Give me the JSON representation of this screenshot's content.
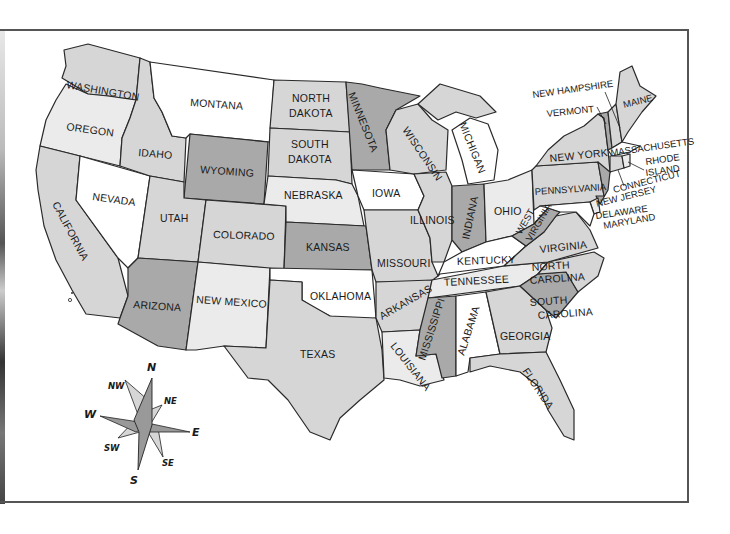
{
  "map": {
    "title": "United States",
    "colors": {
      "white": "#ffffff",
      "light": "#ebebeb",
      "medium": "#d6d6d6",
      "dark": "#a9a9a9",
      "border": "#2a2a2a",
      "frame": "#555555"
    },
    "states": {
      "washington": "WASHINGTON",
      "oregon": "OREGON",
      "california": "CALIFORNIA",
      "nevada": "NEVADA",
      "idaho": "IDAHO",
      "montana": "MONTANA",
      "wyoming": "WYOMING",
      "utah": "UTAH",
      "arizona": "ARIZONA",
      "colorado": "COLORADO",
      "new_mexico": "NEW MEXICO",
      "north_dakota_1": "NORTH",
      "north_dakota_2": "DAKOTA",
      "south_dakota_1": "SOUTH",
      "south_dakota_2": "DAKOTA",
      "nebraska": "NEBRASKA",
      "kansas": "KANSAS",
      "oklahoma": "OKLAHOMA",
      "texas": "TEXAS",
      "minnesota": "MINNESOTA",
      "iowa": "IOWA",
      "missouri": "MISSOURI",
      "arkansas": "ARKANSAS",
      "louisiana": "LOUISIANA",
      "wisconsin": "WISCONSIN",
      "michigan": "MICHIGAN",
      "illinois": "ILLINOIS",
      "indiana": "INDIANA",
      "ohio": "OHIO",
      "kentucky": "KENTUCKY",
      "tennessee": "TENNESSEE",
      "mississippi": "MISSISSIPPI",
      "alabama": "ALABAMA",
      "georgia": "GEORGIA",
      "florida": "FLORIDA",
      "south_carolina_1": "SOUTH",
      "south_carolina_2": "CAROLINA",
      "north_carolina_1": "NORTH",
      "north_carolina_2": "CAROLINA",
      "virginia": "VIRGINIA",
      "west_virginia_1": "WEST",
      "west_virginia_2": "VIRGINIA",
      "pennsylvania": "PENNSYLVANIA",
      "new_york": "NEW YORK",
      "vermont": "VERMONT",
      "new_hampshire": "NEW HAMPSHIRE",
      "maine": "MAINE",
      "massachusetts": "MASSACHUSETTS",
      "rhode_island_1": "RHODE",
      "rhode_island_2": "ISLAND",
      "connecticut": "CONNECTICUT",
      "new_jersey": "NEW JERSEY",
      "delaware": "DELAWARE",
      "maryland": "MARYLAND"
    },
    "compass": {
      "n": "N",
      "ne": "NE",
      "e": "E",
      "se": "SE",
      "s": "S",
      "sw": "SW",
      "w": "W",
      "nw": "NW"
    }
  }
}
